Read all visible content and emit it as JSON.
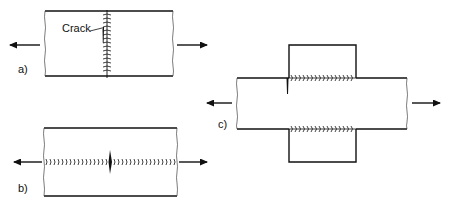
{
  "figure": {
    "colors": {
      "line": "#111111",
      "background": "#ffffff"
    },
    "panels": [
      {
        "id": "a",
        "label": "a)",
        "annotation": "Crack",
        "type": "transverse butt weld",
        "load": "tension-left-right-arrows"
      },
      {
        "id": "b",
        "label": "b)",
        "type": "longitudinal butt weld",
        "load": "tension-left-right-arrows"
      },
      {
        "id": "c",
        "label": "c)",
        "type": "cover plates with longitudinal fillet welds",
        "load": "tension-left-right-arrows"
      }
    ]
  }
}
